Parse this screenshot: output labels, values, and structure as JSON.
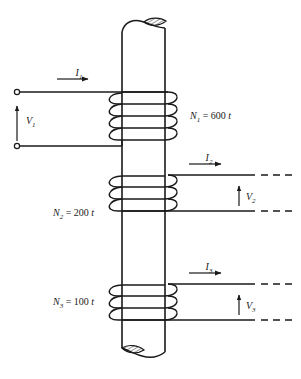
{
  "figure": {
    "background_color": "#ffffff",
    "line_color": "#1a1a1a",
    "text_color": "#1a1a1a"
  },
  "core": {
    "name": "magnetic core",
    "orientation": "vertical",
    "top_break": "hatched broken end",
    "bottom_break": "hatched broken end"
  },
  "windings": [
    {
      "id": "primary",
      "label_N": "N",
      "label_sub": "1",
      "label_eq": " = 600 ",
      "label_unit": "t",
      "label_full": "N1 = 600 t",
      "turns_drawn": 4,
      "side": "left",
      "current_label": "I",
      "current_sub": "1",
      "voltage_label": "V",
      "voltage_sub": "1",
      "terminals": "open circles"
    },
    {
      "id": "secondary-2",
      "label_N": "N",
      "label_sub": "2",
      "label_eq": " = 200 ",
      "label_unit": "t",
      "label_full": "N2 = 200 t",
      "turns_drawn": 3,
      "side": "right",
      "current_label": "I",
      "current_sub": "2",
      "voltage_label": "V",
      "voltage_sub": "2",
      "terminals": "dashed continuation"
    },
    {
      "id": "secondary-3",
      "label_N": "N",
      "label_sub": "3",
      "label_eq": " = 100 ",
      "label_unit": "t",
      "label_full": "N3 = 100 t",
      "turns_drawn": 3,
      "side": "right",
      "current_label": "I",
      "current_sub": "3",
      "voltage_label": "V",
      "voltage_sub": "3",
      "terminals": "dashed continuation"
    }
  ]
}
